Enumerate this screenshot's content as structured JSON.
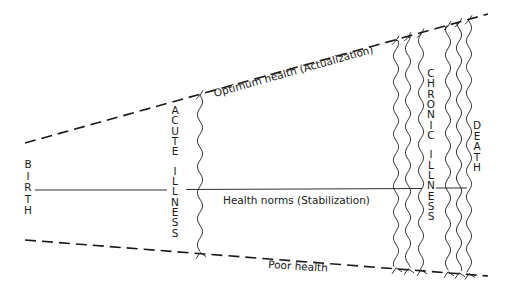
{
  "diagram": {
    "lines": {
      "optimum": "Optimum health (Actualization)",
      "norms": "Health norms (Stabilization)",
      "poor": "Poor health"
    },
    "vertical_labels": {
      "birth": "BIRTH",
      "acute": "ACUTE ILLNESS",
      "chronic": "CHRONIC ILLNESS",
      "death": "DEATH"
    },
    "colors": {
      "ink": "#1a1a1a",
      "background": "#ffffff"
    }
  }
}
